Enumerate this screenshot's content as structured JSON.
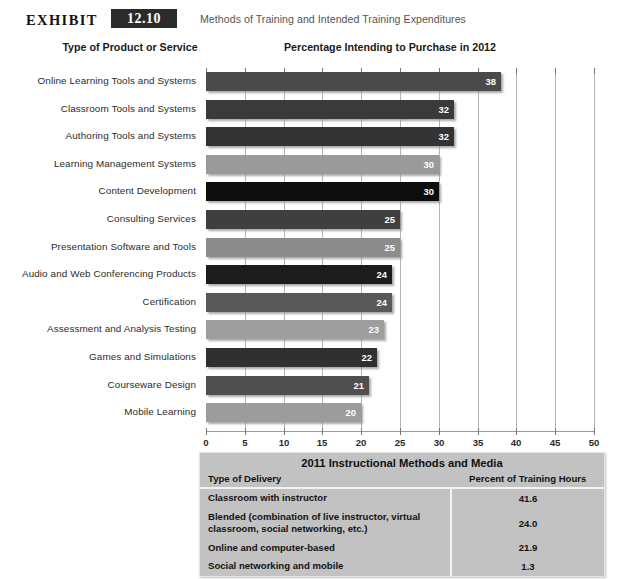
{
  "header": {
    "exhibit_word": "EXHIBIT",
    "exhibit_number": "12.10",
    "caption": "Methods of Training and Intended Training Expenditures"
  },
  "column_headings": {
    "left": "Type of Product or Service",
    "right": "Percentage Intending to Purchase in 2012"
  },
  "chart_data": {
    "type": "bar",
    "orientation": "horizontal",
    "title": "Percentage Intending to Purchase in 2012",
    "xlabel": "",
    "ylabel": "Type of Product or Service",
    "xlim": [
      0,
      50
    ],
    "xticks": [
      0,
      5,
      10,
      15,
      20,
      25,
      30,
      35,
      40,
      45,
      50
    ],
    "grid": true,
    "legend": "none",
    "categories": [
      "Online Learning Tools and Systems",
      "Classroom Tools and Systems",
      "Authoring Tools and Systems",
      "Learning Management Systems",
      "Content Development",
      "Consulting Services",
      "Presentation Software and Tools",
      "Audio and Web Conferencing Products",
      "Certification",
      "Assessment and Analysis Testing",
      "Games and Simulations",
      "Courseware Design",
      "Mobile Learning"
    ],
    "values": [
      38,
      32,
      32,
      30,
      30,
      25,
      25,
      24,
      24,
      23,
      22,
      21,
      20
    ],
    "bar_colors": [
      "#4a4a4a",
      "#3a3a3a",
      "#333333",
      "#9a9a9a",
      "#0d0d0d",
      "#3f3f3f",
      "#8c8c8c",
      "#1c1c1c",
      "#595959",
      "#9e9e9e",
      "#303030",
      "#4f4f4f",
      "#9c9c9c"
    ]
  },
  "table": {
    "title": "2011 Instructional Methods and Media",
    "columns": [
      "Type of Delivery",
      "Percent of Training Hours"
    ],
    "rows": [
      {
        "delivery": "Classroom with instructor",
        "percent": "41.6"
      },
      {
        "delivery": "Blended (combination of live instructor, virtual classroom, social  networking, etc.)",
        "percent": "24.0"
      },
      {
        "delivery": "Online and computer-based",
        "percent": "21.9"
      },
      {
        "delivery": "Social networking and mobile",
        "percent": "1.3"
      }
    ]
  }
}
